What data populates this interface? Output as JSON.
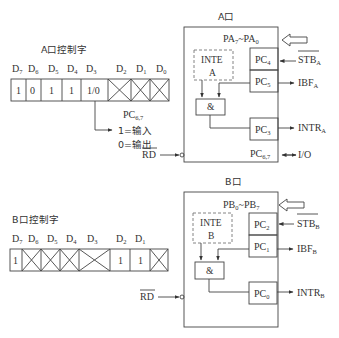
{
  "portA": {
    "title": "A口",
    "control_label": "A口控制字",
    "bits": [
      {
        "name": "D",
        "sub": "7",
        "value": "1"
      },
      {
        "name": "D",
        "sub": "6",
        "value": "0"
      },
      {
        "name": "D",
        "sub": "5",
        "value": "1"
      },
      {
        "name": "D",
        "sub": "4",
        "value": "1"
      },
      {
        "name": "D",
        "sub": "3",
        "value": "1/0"
      },
      {
        "name": "D",
        "sub": "2",
        "value": "X"
      },
      {
        "name": "D",
        "sub": "1",
        "value": "X"
      },
      {
        "name": "D",
        "sub": "0",
        "value": "X"
      }
    ],
    "pc67_note": {
      "label": "PC",
      "sub": "6,7",
      "line1": "1=输入",
      "line2": "0=输出"
    },
    "bus": {
      "a": "PA",
      "asub": "7",
      "sep": "~",
      "b": "PA",
      "bsub": "0"
    },
    "inte": {
      "line1": "INTE",
      "line2": "A"
    },
    "and_gate": "&",
    "pins": [
      {
        "label": "PC",
        "sub": "4",
        "signal": "STB",
        "ssub": "A",
        "overline": true,
        "direction": "in"
      },
      {
        "label": "PC",
        "sub": "5",
        "signal": "IBF",
        "ssub": "A",
        "overline": false,
        "direction": "out"
      },
      {
        "label": "PC",
        "sub": "3",
        "signal": "INTR",
        "ssub": "A",
        "overline": false,
        "direction": "out"
      },
      {
        "label": "PC",
        "sub": "6,7",
        "signal": "I/O",
        "ssub": "",
        "overline": false,
        "direction": "bi"
      }
    ],
    "rd": "RD"
  },
  "portB": {
    "title": "B口",
    "control_label": "B口控制字",
    "bits": [
      {
        "name": "D",
        "sub": "7",
        "value": "1"
      },
      {
        "name": "D",
        "sub": "6",
        "value": "X"
      },
      {
        "name": "D",
        "sub": "5",
        "value": "X"
      },
      {
        "name": "D",
        "sub": "4",
        "value": "X"
      },
      {
        "name": "D",
        "sub": "3",
        "value": "X"
      },
      {
        "name": "D",
        "sub": "2",
        "value": "1"
      },
      {
        "name": "D",
        "sub": "1",
        "value": "1"
      },
      {
        "name": "D",
        "sub": "0",
        "value": "X"
      }
    ],
    "bus": {
      "a": "PB",
      "asub": "0",
      "sep": "~",
      "b": "PB",
      "bsub": "7"
    },
    "inte": {
      "line1": "INTE",
      "line2": "B"
    },
    "and_gate": "&",
    "pins": [
      {
        "label": "PC",
        "sub": "2",
        "signal": "STB",
        "ssub": "B",
        "overline": true,
        "direction": "in"
      },
      {
        "label": "PC",
        "sub": "1",
        "signal": "IBF",
        "ssub": "B",
        "overline": false,
        "direction": "out"
      },
      {
        "label": "PC",
        "sub": "0",
        "signal": "INTR",
        "ssub": "B",
        "overline": false,
        "direction": "out"
      }
    ],
    "rd": "RD"
  }
}
